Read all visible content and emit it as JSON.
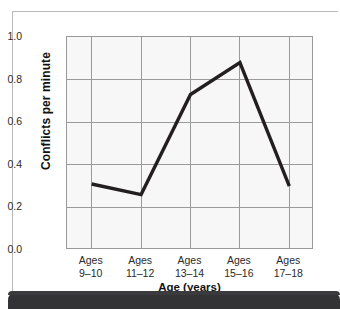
{
  "chart_data": {
    "type": "line",
    "title": "",
    "subtitle": "",
    "xlabel": "Age (years)",
    "ylabel": "Conflicts per minute",
    "categories": [
      "Ages 9–10",
      "Ages 11–12",
      "Ages 13–14",
      "Ages 15–16",
      "Ages 17–18"
    ],
    "category_lines": [
      [
        "Ages",
        "9–10"
      ],
      [
        "Ages",
        "11–12"
      ],
      [
        "Ages",
        "13–14"
      ],
      [
        "Ages",
        "15–16"
      ],
      [
        "Ages",
        "17–18"
      ]
    ],
    "values": [
      0.31,
      0.26,
      0.73,
      0.88,
      0.3
    ],
    "ylim": [
      0.0,
      1.0
    ],
    "ytick_labels": [
      "1.0",
      "0.8",
      "0.6",
      "0.4",
      "0.2",
      "0.0"
    ],
    "ytick_values": [
      1.0,
      0.8,
      0.6,
      0.4,
      0.2,
      0.0
    ],
    "grid": "both",
    "legend": "none",
    "series_color": "#231f20",
    "plot_background": "#f7f7f7",
    "grid_color": "#9a9a9a"
  },
  "figure": {
    "band_color": "#333235",
    "frame_color": "#b9b9b9",
    "page_background": "#ffffff"
  }
}
